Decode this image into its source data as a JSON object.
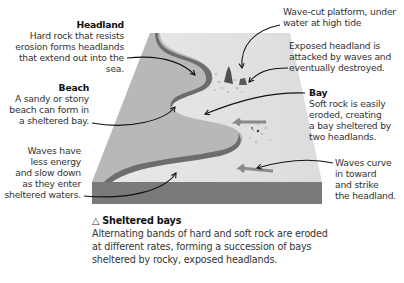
{
  "labels": {
    "headland": {
      "title": "Headland",
      "lines": [
        "Hard rock that resists",
        "erosion forms headlands",
        "that extend out into the sea."
      ]
    },
    "beach": {
      "title": "Beach",
      "lines": [
        "A sandy or stony",
        "beach can form in",
        "a sheltered bay."
      ]
    },
    "waves_energy": {
      "lines": [
        "Waves have",
        "less energy",
        "and slow down",
        "as they enter",
        "sheltered waters."
      ]
    },
    "wave_cut_platform": {
      "lines": [
        "Wave-cut platform, under",
        "water at high tide"
      ]
    },
    "exposed_headland": {
      "lines": [
        "Exposed headland is",
        "attacked by waves and",
        "eventually destroyed."
      ]
    },
    "bay": {
      "title": "Bay",
      "lines": [
        "Soft rock is easily",
        "eroded, creating",
        "a bay sheltered by",
        "two headlands."
      ]
    },
    "waves_curve": {
      "lines": [
        "Waves curve",
        "in toward",
        "and strike",
        "the headland."
      ]
    }
  },
  "caption": {
    "icon": "triangle-outline-icon",
    "icon_glyph": "△",
    "title": "Sheltered bays",
    "lines": [
      "Alternating bands of hard and soft rock are eroded",
      "at different rates, forming a succession of bays",
      "sheltered by rocky, exposed headlands."
    ]
  },
  "colors": {
    "land": "#b9b9b9",
    "sea_surface": "#e4e4e4",
    "cliff_face": "#6f6f6f",
    "block_front": "#7b7b7b",
    "arrow": "#111111",
    "wave_arrow": "#8a8a8a"
  }
}
